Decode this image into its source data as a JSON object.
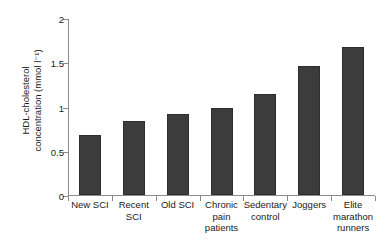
{
  "chart_data": {
    "type": "bar",
    "title": "",
    "xlabel": "",
    "ylabel_line1": "HDL-cholesterol",
    "ylabel_line2": "concentration (mmol l⁻¹)",
    "ylabel": "HDL-cholesterol concentration (mmol l⁻¹)",
    "categories": [
      "New SCI",
      "Recent SCI",
      "Old SCI",
      "Chronic pain patients",
      "Sedentary control",
      "Joggers",
      "Elite marathon runners"
    ],
    "category_lines": [
      [
        "New SCI"
      ],
      [
        "Recent",
        "SCI"
      ],
      [
        "Old SCI"
      ],
      [
        "Chronic",
        "pain",
        "patients"
      ],
      [
        "Sedentary",
        "control"
      ],
      [
        "Joggers"
      ],
      [
        "Elite",
        "marathon",
        "runners"
      ]
    ],
    "values": [
      0.68,
      0.84,
      0.91,
      0.98,
      1.14,
      1.46,
      1.67
    ],
    "ylim": [
      0,
      2
    ],
    "yticks": [
      0,
      0.5,
      1,
      1.5,
      2
    ],
    "ytick_labels": [
      "0",
      "0.5",
      "1",
      "1.5",
      "2"
    ],
    "grid": false,
    "legend": false,
    "bar_color": "#3c3c3c",
    "axis_color": "#8c8c8c",
    "text_color": "#1a1a1a",
    "background": "#ffffff"
  }
}
